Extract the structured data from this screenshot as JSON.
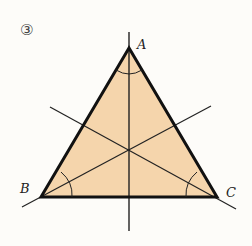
{
  "figure": {
    "number_label": "③",
    "fill_color": "#f5d5ac",
    "stroke_color": "#1a1a1a",
    "vertices": {
      "A": {
        "label": "A",
        "x": 129,
        "y": 48
      },
      "B": {
        "label": "B",
        "x": 41,
        "y": 197
      },
      "C": {
        "label": "C",
        "x": 217,
        "y": 197
      }
    },
    "bisector_lines": [
      {
        "name": "bisector-A",
        "x1": 129,
        "y1": 32,
        "x2": 129,
        "y2": 231
      },
      {
        "name": "bisector-B",
        "x1": 22,
        "y1": 207,
        "x2": 211,
        "y2": 106
      },
      {
        "name": "bisector-C",
        "x1": 50,
        "y1": 107,
        "x2": 236,
        "y2": 209
      }
    ]
  }
}
